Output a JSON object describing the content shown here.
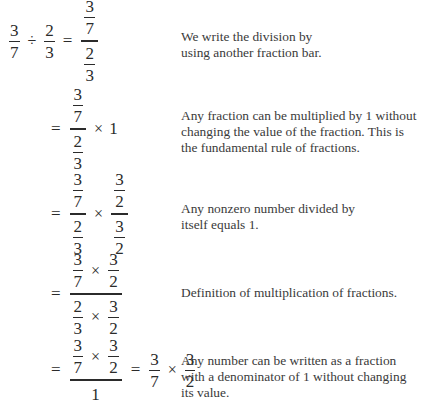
{
  "steps": [
    {
      "expression": {
        "lhs": {
          "a_num": "3",
          "a_den": "7",
          "op": "÷",
          "b_num": "2",
          "b_den": "3"
        },
        "eq": "=",
        "rhs": {
          "top_num": "3",
          "top_den": "7",
          "bot_num": "2",
          "bot_den": "3"
        }
      },
      "explanation": "We write the division by using another fraction bar."
    },
    {
      "expression": {
        "eq": "=",
        "rhs": {
          "top_num": "3",
          "top_den": "7",
          "bot_num": "2",
          "bot_den": "3",
          "op": "×",
          "factor": "1"
        }
      },
      "explanation": "Any fraction can be multiplied by 1 without changing the value of the fraction. This is the fundamental rule of fractions."
    },
    {
      "expression": {
        "eq": "=",
        "left": {
          "top_num": "3",
          "top_den": "7",
          "bot_num": "2",
          "bot_den": "3"
        },
        "op": "×",
        "right": {
          "top_num": "3",
          "top_den": "2",
          "bot_num": "3",
          "bot_den": "2"
        }
      },
      "explanation": "Any nonzero number divided by itself equals 1."
    },
    {
      "expression": {
        "eq": "=",
        "numerator": {
          "a_num": "3",
          "a_den": "7",
          "op": "×",
          "b_num": "3",
          "b_den": "2"
        },
        "denominator": {
          "a_num": "2",
          "a_den": "3",
          "op": "×",
          "b_num": "3",
          "b_den": "2"
        }
      },
      "explanation": "Definition of multiplication of fractions."
    },
    {
      "expression": {
        "eq": "=",
        "numerator": {
          "a_num": "3",
          "a_den": "7",
          "op": "×",
          "b_num": "3",
          "b_den": "2"
        },
        "denominator": "1",
        "eq2": "=",
        "result": {
          "a_num": "3",
          "a_den": "7",
          "op": "×",
          "b_num": "3",
          "b_den": "2"
        }
      },
      "explanation": "Any number can be written as a fraction with a denominator of 1 without changing its value."
    }
  ]
}
